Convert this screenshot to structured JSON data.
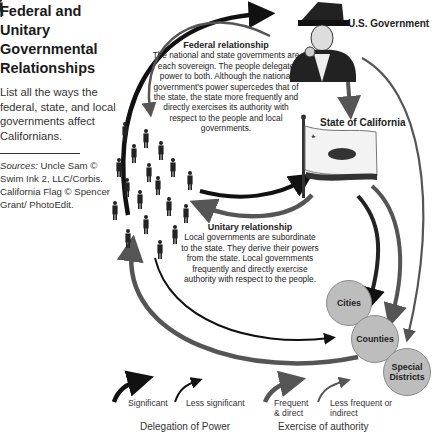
{
  "sidebar": {
    "title": "Federal and Unitary Governmental Relationships",
    "prompt": "List all the ways the federal, state, and local governments affect Californians.",
    "sources_label": "Sources:",
    "sources_text": " Uncle Sam © Swim Ink 2, LLC/Corbis. California Flag © Spencer Grant/ PhotoEdit."
  },
  "nodes": {
    "federal": "U.S. Government",
    "state": "State of California",
    "local": [
      "Cities",
      "Counties",
      "Special Districts"
    ],
    "people_icon": "people-crowd-icon",
    "federal_icon": "uncle-sam-image",
    "state_icon": "california-flag-image"
  },
  "federal_relationship": {
    "title": "Federal relationship",
    "text": "The national and state governments are each sovereign. The people delegate power to both. Although the national government's power supercedes that of the state, the state more frequently and directly exercises its authority with respect to the people and local governments."
  },
  "unitary_relationship": {
    "title": "Unitary relationship",
    "text": "Local governments are subordinate to the state. They derive their powers from the state. Local governments frequently and directly exercise authority with respect to the people."
  },
  "legend": {
    "delegation": {
      "group_label": "Delegation of Power",
      "items": [
        "Significant",
        "Less significant"
      ],
      "color": "#111111"
    },
    "authority": {
      "group_label": "Exercise of authority",
      "items": [
        "Frequent & direct",
        "Less frequent or indirect"
      ],
      "color": "#555555"
    }
  },
  "colors": {
    "delegation_arrow": "#111111",
    "authority_arrow": "#555555",
    "local_circle": "#bdbdbd"
  }
}
